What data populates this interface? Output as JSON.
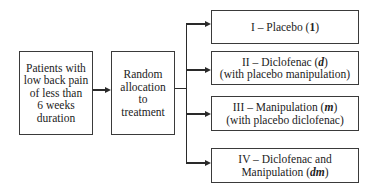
{
  "diagram": {
    "type": "flowchart",
    "source_box": {
      "lines": [
        "Patients with",
        "low back pain",
        "of less than",
        "6 weeks",
        "duration"
      ]
    },
    "allocation_box": {
      "lines": [
        "Random",
        "allocation",
        "to",
        "treatment"
      ]
    },
    "arms": [
      {
        "line1_prefix": "I – Placebo (",
        "symbol": "1",
        "line1_suffix": ")",
        "line2": ""
      },
      {
        "line1_prefix": "II – Diclofenac (",
        "symbol": "d",
        "line1_suffix": ")",
        "line2": "(with placebo manipulation)"
      },
      {
        "line1_prefix": "III – Manipulation (",
        "symbol": "m",
        "line1_suffix": ")",
        "line2": "(with placebo diclofenac)"
      },
      {
        "line1": "IV – Diclofenac and",
        "line2_prefix": "Manipulation (",
        "symbol": "dm",
        "line2_suffix": ")"
      }
    ],
    "colors": {
      "line": "#2a2a2a",
      "border": "#3a3a3a",
      "background": "#ffffff"
    }
  }
}
